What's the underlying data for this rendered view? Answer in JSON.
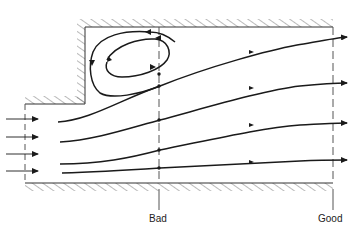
{
  "diagram": {
    "type": "flow-separation-schematic",
    "colors": {
      "stroke": "#1a1a1a",
      "hatch": "#555555",
      "dash": "#555555",
      "background": "#ffffff"
    },
    "stations": [
      {
        "id": "bad",
        "label": "Bad",
        "x": 159
      },
      {
        "id": "good",
        "label": "Good",
        "x": 333
      }
    ],
    "inlet_arrows": 4,
    "streamlines": 4,
    "vortex_loops": 2
  }
}
